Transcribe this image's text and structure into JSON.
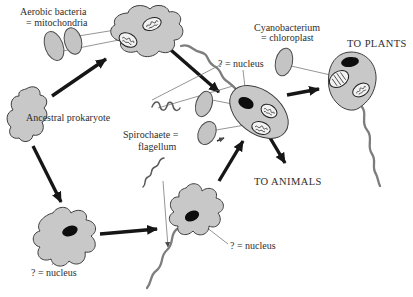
{
  "diagram": {
    "name": "Endosymbiotic origin of eukaryotic cells",
    "labels": {
      "aerobic_line1": "Aerobic bacteria",
      "aerobic_line2": "= mitochondria",
      "cyano_line1": "Cyanobacterium",
      "cyano_line2": "= chloroplast",
      "to_plants": "TO PLANTS",
      "to_animals": "TO ANIMALS",
      "ancestral_prokaryote": "Ancestral prokaryote",
      "spirochaete_line1": "Spirochaete =",
      "spirochaete_line2": "flagellum",
      "question_nucleus": "? = nucleus"
    },
    "colors": {
      "background": "#ffffff",
      "cell_fill": "#c8c8c8",
      "cell_outline": "#3d3d3d",
      "nucleus_fill": "#0d0d0d",
      "organelle_fill": "#f2f2f2",
      "arrow": "#161616",
      "connector_line": "#7a7a7a",
      "text": "#2e2e2e"
    }
  }
}
